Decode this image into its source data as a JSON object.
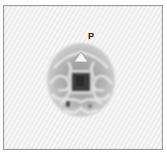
{
  "figure": {
    "label": "P",
    "colors": {
      "background": "#f1f1f1",
      "border": "#9a9a9a",
      "grain_outer": "#b8b8b8",
      "grain_ridges": "#e8e8e8",
      "grain_center": "#3a3a3a",
      "label": "#222222"
    }
  }
}
